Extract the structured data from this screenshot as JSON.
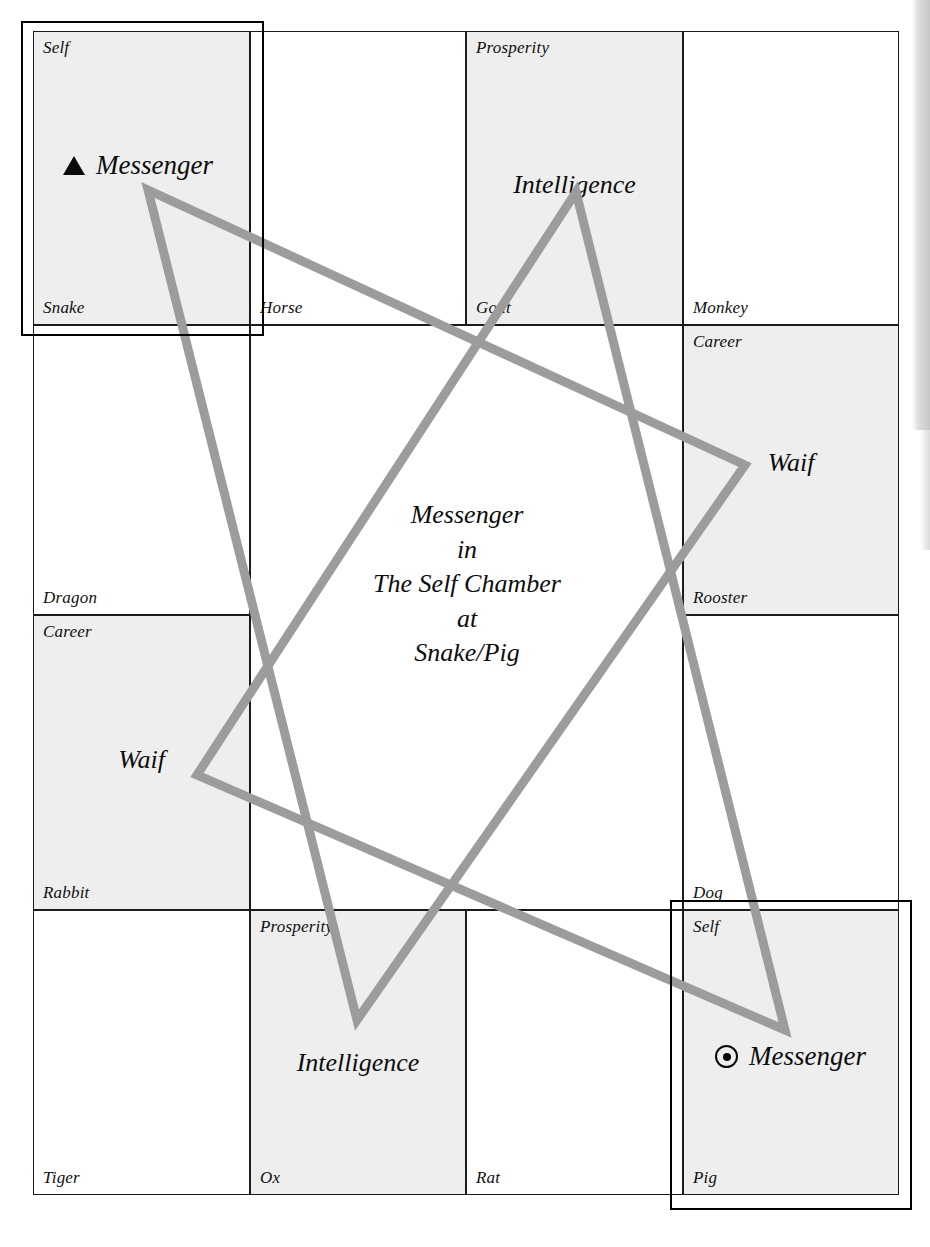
{
  "diagram": {
    "title": "Messenger in The Self Chamber at Snake/Pig",
    "accent_color": "#9c9c9c",
    "grid_line_color": "#1b1b1b",
    "shaded_cell_color": "#eeeeee"
  },
  "center_caption": {
    "line1": "Messenger",
    "line2": "in",
    "line3": "The Self Chamber",
    "line4": "at",
    "line5": "Snake/Pig"
  },
  "cells": [
    {
      "id": "snake",
      "branch": "Snake",
      "chamber": "Self",
      "content": "Messenger",
      "marker": "triangle-marker",
      "shaded": true,
      "highlighted": true
    },
    {
      "id": "horse",
      "branch": "Horse",
      "chamber": "",
      "content": "",
      "marker": "",
      "shaded": false,
      "highlighted": false
    },
    {
      "id": "goat",
      "branch": "Goat",
      "chamber": "Prosperity",
      "content": "Intelligence",
      "marker": "",
      "shaded": true,
      "highlighted": false
    },
    {
      "id": "monkey",
      "branch": "Monkey",
      "chamber": "",
      "content": "",
      "marker": "",
      "shaded": false,
      "highlighted": false
    },
    {
      "id": "dragon",
      "branch": "Dragon",
      "chamber": "",
      "content": "",
      "marker": "",
      "shaded": false,
      "highlighted": false
    },
    {
      "id": "rooster",
      "branch": "Rooster",
      "chamber": "Career",
      "content": "Waif",
      "marker": "",
      "shaded": true,
      "highlighted": false
    },
    {
      "id": "rabbit",
      "branch": "Rabbit",
      "chamber": "Career",
      "content": "Waif",
      "marker": "",
      "shaded": true,
      "highlighted": false
    },
    {
      "id": "dog",
      "branch": "Dog",
      "chamber": "",
      "content": "",
      "marker": "",
      "shaded": false,
      "highlighted": false
    },
    {
      "id": "tiger",
      "branch": "Tiger",
      "chamber": "",
      "content": "",
      "marker": "",
      "shaded": false,
      "highlighted": false
    },
    {
      "id": "ox",
      "branch": "Ox",
      "chamber": "Prosperity",
      "content": "Intelligence",
      "marker": "",
      "shaded": true,
      "highlighted": false
    },
    {
      "id": "rat",
      "branch": "Rat",
      "chamber": "",
      "content": "",
      "marker": "",
      "shaded": false,
      "highlighted": false
    },
    {
      "id": "pig",
      "branch": "Pig",
      "chamber": "Self",
      "content": "Messenger",
      "marker": "circle-dot-marker",
      "shaded": true,
      "highlighted": true
    }
  ]
}
